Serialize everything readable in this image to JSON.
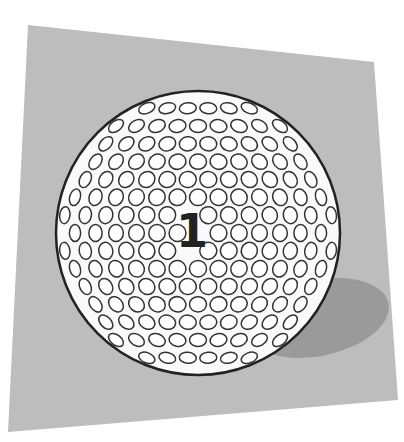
{
  "scene": {
    "description": "Illustration of a white golf ball with circular dimples, marked with the number 1, resting on a tilted gray square with a cast shadow",
    "ball_number": "1",
    "colors": {
      "background": "#ffffff",
      "mat": "#bdbdbd",
      "shadow": "#9a9a9a",
      "ball": "#fafafa",
      "outline": "#222222",
      "dimple_stroke": "#333333",
      "number": "#222222"
    },
    "mat_polygon": [
      [
        28,
        25
      ],
      [
        374,
        62
      ],
      [
        398,
        400
      ],
      [
        8,
        432
      ]
    ],
    "ball": {
      "cx": 198,
      "cy": 233,
      "r": 142
    },
    "shadow": {
      "cx": 318,
      "cy": 318,
      "rx": 72,
      "ry": 38,
      "rotate": -12
    },
    "dimple": {
      "r": 8.5,
      "spacing": 20.5
    }
  }
}
